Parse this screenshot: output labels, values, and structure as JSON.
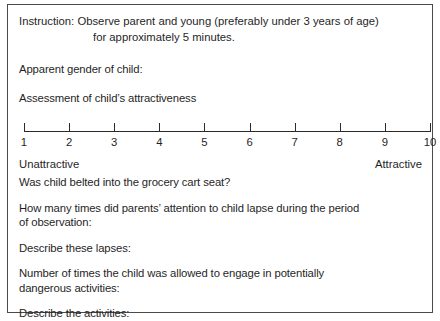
{
  "form": {
    "instruction": {
      "line1": "Instruction: Observe parent and young (preferably under 3 years of age)",
      "line2": "for approximately 5 minutes."
    },
    "questions": {
      "gender": "Apparent gender of child:",
      "attractiveness": "Assessment of child’s attractiveness",
      "belted": "Was child belted into the grocery cart seat?",
      "lapses_count_line1": "How many times did parents’ attention to child lapse during the period",
      "lapses_count_line2": "of observation:",
      "describe_lapses": "Describe these lapses:",
      "dangerous_line1": "Number of times the child was allowed to engage in potentially",
      "dangerous_line2": "dangerous activities:",
      "describe_activities": "Describe the activities:"
    },
    "scale": {
      "ticks": [
        "1",
        "2",
        "3",
        "4",
        "5",
        "6",
        "7",
        "8",
        "9",
        "10"
      ],
      "anchor_low": "Unattractive",
      "anchor_high": "Attractive",
      "min": 1,
      "max": 10
    },
    "colors": {
      "border": "#4a4a4a",
      "text": "#1f1f1f",
      "axis": "#2a2a2a",
      "background": "#ffffff"
    }
  }
}
